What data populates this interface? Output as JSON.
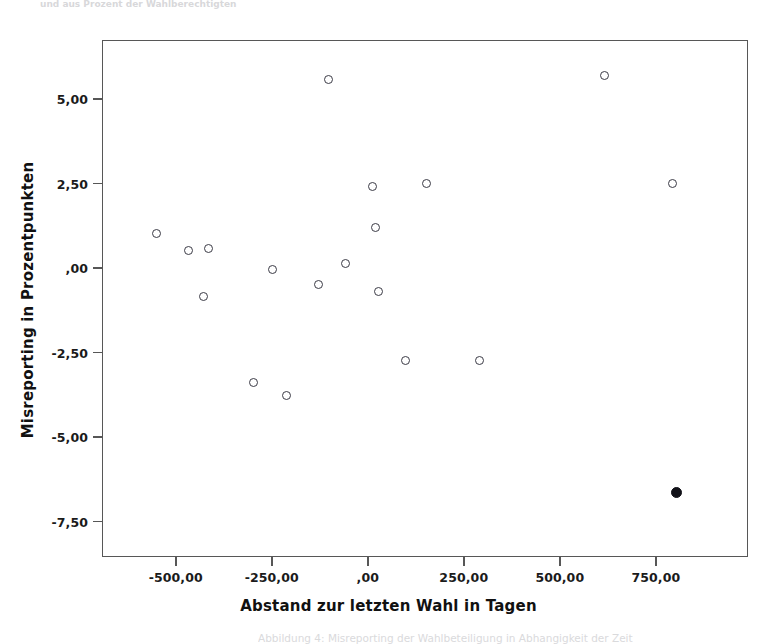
{
  "figure": {
    "top_caption": "und aus Prozent der Wahlberechtigten",
    "bottom_caption": "Abbildung 4: Misreporting der Wahlbeteiligung in Abhangigkeit der Zeit"
  },
  "chart_data": {
    "type": "scatter",
    "title": "",
    "subtitle": "",
    "xlabel": "Abstand zur letzten Wahl in Tagen",
    "ylabel": "Misreporting in Prozentpunkten",
    "xlim": [
      -692,
      990
    ],
    "ylim": [
      -8.55,
      6.75
    ],
    "grid": false,
    "legend": null,
    "legend_position": "none",
    "xticks": [
      -500,
      -250,
      0,
      250,
      500,
      750
    ],
    "xticklabels": [
      "-500,00",
      "-250,00",
      ",00",
      "250,00",
      "500,00",
      "750,00"
    ],
    "yticks": [
      5.0,
      2.5,
      0.0,
      -2.5,
      -5.0,
      -7.5
    ],
    "yticklabels": [
      "5,00",
      "2,50",
      ",00",
      "-2,50",
      "-5,00",
      "-7,50"
    ],
    "marker_styles": {
      "open": "hollow-circle",
      "filled": "solid-circle"
    },
    "series": [
      {
        "name": "Befragungen",
        "marker": "open",
        "points": [
          {
            "x": -552,
            "y": 1.05
          },
          {
            "x": -470,
            "y": 0.55
          },
          {
            "x": -418,
            "y": 0.62
          },
          {
            "x": -430,
            "y": -0.8
          },
          {
            "x": -300,
            "y": -3.35
          },
          {
            "x": -250,
            "y": -0.02
          },
          {
            "x": -215,
            "y": -3.75
          },
          {
            "x": -130,
            "y": -0.45
          },
          {
            "x": -105,
            "y": 5.62
          },
          {
            "x": -60,
            "y": 0.16
          },
          {
            "x": 10,
            "y": 2.44
          },
          {
            "x": 18,
            "y": 1.22
          },
          {
            "x": 25,
            "y": -0.65
          },
          {
            "x": 95,
            "y": -2.72
          },
          {
            "x": 150,
            "y": 2.52
          },
          {
            "x": 288,
            "y": -2.72
          },
          {
            "x": 615,
            "y": 5.72
          },
          {
            "x": 790,
            "y": 2.52
          }
        ]
      },
      {
        "name": "Hervorgehobener Fall",
        "marker": "filled",
        "points": [
          {
            "x": 800,
            "y": -6.62
          }
        ]
      }
    ]
  }
}
